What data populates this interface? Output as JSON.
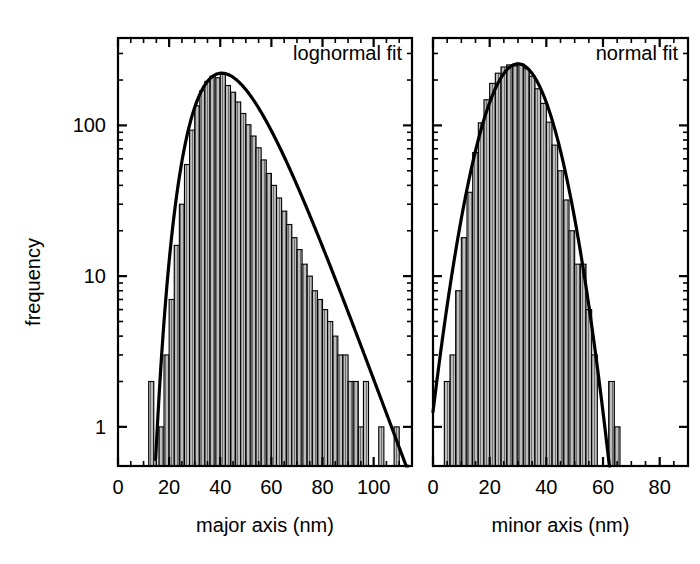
{
  "figure": {
    "background": "#ffffff",
    "ink": "#000000",
    "bar_fill": "#b4b4b4",
    "bar_stroke": "#000000",
    "fit_stroke": "#000000"
  },
  "axes": {
    "y_label": "frequency",
    "y_ticks": [
      "1",
      "10",
      "100"
    ],
    "y_tick_values": [
      1,
      10,
      100
    ],
    "y_scale": "log",
    "y_lim": [
      0.55,
      380
    ]
  },
  "chart_data": [
    {
      "type": "bar",
      "panel": "left",
      "title": "",
      "annotation": "lognormal fit",
      "xlabel": "major axis (nm)",
      "ylabel": "frequency",
      "yscale": "log",
      "ylim": [
        0.55,
        380
      ],
      "xlim": [
        0,
        115
      ],
      "xticks": [
        0,
        20,
        40,
        60,
        80,
        100
      ],
      "xtick_labels": [
        "0",
        "20",
        "40",
        "60",
        "80",
        "100"
      ],
      "minor_tick_step": 5,
      "grid": false,
      "bin_width": 2,
      "bin_left_edges": [
        12,
        14,
        16,
        18,
        20,
        22,
        24,
        26,
        28,
        30,
        32,
        34,
        36,
        38,
        40,
        42,
        44,
        46,
        48,
        50,
        52,
        54,
        56,
        58,
        60,
        62,
        64,
        66,
        68,
        70,
        72,
        74,
        76,
        78,
        80,
        82,
        84,
        86,
        88,
        90,
        92,
        94,
        96,
        98,
        100,
        102,
        104,
        106,
        108,
        110
      ],
      "values": [
        2,
        0,
        1,
        3,
        7,
        16,
        30,
        55,
        93,
        135,
        170,
        196,
        212,
        207,
        218,
        184,
        166,
        143,
        120,
        101,
        85,
        71,
        59,
        48,
        40,
        33,
        27,
        22,
        18,
        15,
        12,
        10,
        8,
        7,
        6,
        5,
        4,
        3,
        3,
        2,
        2,
        1,
        2,
        0,
        0,
        1,
        0,
        0,
        1,
        0
      ],
      "fit": {
        "name": "lognormal fit",
        "type": "lognormal",
        "mu": 3.79,
        "sigma": 0.295,
        "amplitude": 222,
        "peak_x": 41,
        "peak_y": 222
      }
    },
    {
      "type": "bar",
      "panel": "right",
      "title": "",
      "annotation": "normal fit",
      "xlabel": "minor axis (nm)",
      "ylabel": "frequency",
      "yscale": "log",
      "ylim": [
        0.55,
        380
      ],
      "xlim": [
        0,
        90
      ],
      "xticks": [
        0,
        20,
        40,
        60,
        80
      ],
      "xtick_labels": [
        "0",
        "20",
        "40",
        "60",
        "80"
      ],
      "minor_tick_step": 5,
      "grid": false,
      "bin_width": 2,
      "bin_left_edges": [
        4,
        6,
        8,
        10,
        12,
        14,
        16,
        18,
        20,
        22,
        24,
        26,
        28,
        30,
        32,
        34,
        36,
        38,
        40,
        42,
        44,
        46,
        48,
        50,
        52,
        54,
        56,
        58,
        60,
        62,
        64
      ],
      "values": [
        2,
        3,
        8,
        18,
        36,
        66,
        104,
        148,
        190,
        222,
        244,
        252,
        248,
        256,
        238,
        212,
        175,
        140,
        105,
        74,
        50,
        32,
        20,
        12,
        12,
        6,
        3,
        0,
        0,
        2,
        1
      ],
      "fit": {
        "name": "normal fit",
        "type": "normal",
        "mean": 30,
        "sigma": 9.2,
        "amplitude": 256,
        "peak_x": 30,
        "peak_y": 256
      }
    }
  ],
  "panels": {
    "left": {
      "note": "lognormal fit",
      "xlabel": "major axis (nm)"
    },
    "right": {
      "note": "normal fit",
      "xlabel": "minor axis (nm)"
    }
  }
}
